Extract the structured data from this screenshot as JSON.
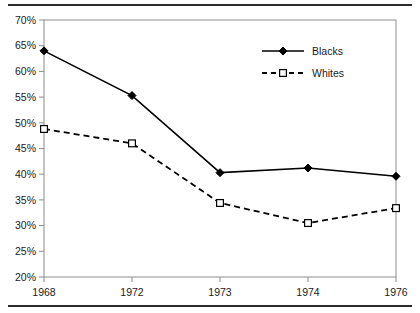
{
  "chart_data": {
    "type": "line",
    "title": "",
    "subtitle": "",
    "xlabel": "",
    "ylabel": "",
    "categories": [
      "1968",
      "1972",
      "1973",
      "1974",
      "1976"
    ],
    "series": [
      {
        "name": "Blacks",
        "values": [
          64.0,
          55.3,
          40.3,
          41.2,
          39.6
        ],
        "line_style": "solid",
        "marker": "filled-diamond",
        "color": "#000000"
      },
      {
        "name": "Whites",
        "values": [
          48.8,
          46.0,
          34.4,
          30.5,
          33.4
        ],
        "line_style": "dashed",
        "marker": "open-square",
        "color": "#000000"
      }
    ],
    "ylim": [
      20,
      70
    ],
    "ytick_step": 5,
    "ytick_labels": [
      "70%",
      "65%",
      "60%",
      "55%",
      "50%",
      "45%",
      "40%",
      "35%",
      "30%",
      "25%",
      "20%"
    ],
    "ytick_values": [
      70,
      65,
      60,
      55,
      50,
      45,
      40,
      35,
      30,
      25,
      20
    ],
    "grid": false,
    "legend_position": "inside-upper-right",
    "value_suffix": "%"
  },
  "legend": {
    "entries": [
      {
        "label": "Blacks"
      },
      {
        "label": "Whites"
      }
    ]
  },
  "colors": {
    "ink": "#000000",
    "axis": "#8c8c8c",
    "rule": "#2b2b2b",
    "text": "#1a1a1a"
  }
}
